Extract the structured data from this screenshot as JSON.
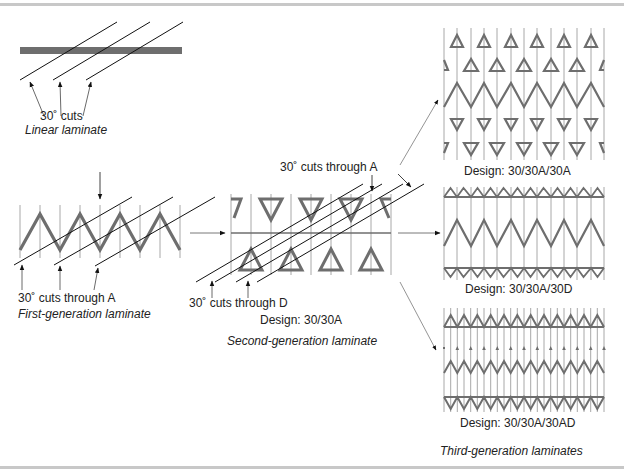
{
  "colors": {
    "laminate": "#6e6e6e",
    "grid": "#a8a8a8",
    "cut": "#111111",
    "frame": "#c8c8c8",
    "text": "#222222"
  },
  "linear": {
    "cut_label": "30˚ cuts",
    "title": "Linear laminate"
  },
  "first_generation": {
    "cut_label": "30˚ cuts through A",
    "title": "First-generation laminate"
  },
  "second_generation": {
    "cut_label_a": "30˚ cuts through A",
    "cut_label_d": "30˚ cuts through D",
    "design": "Design: 30/30A",
    "title": "Second-generation laminate"
  },
  "third_generation": {
    "panels": [
      {
        "design": "Design: 30/30A/30A"
      },
      {
        "design": "Design: 30/30A/30D"
      },
      {
        "design": "Design: 30/30A/30AD"
      }
    ],
    "title": "Third-generation laminates"
  }
}
